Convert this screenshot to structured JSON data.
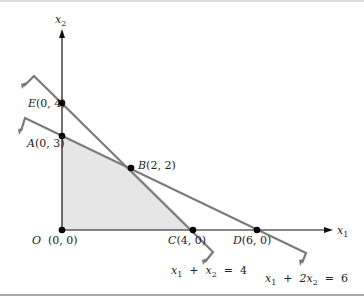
{
  "figure": {
    "axes": {
      "x_label": "x",
      "x_label_sub": "1",
      "y_label": "x",
      "y_label_sub": "2"
    },
    "points": [
      {
        "id": "O",
        "letter": "O",
        "coords": "(0, 0)",
        "x": 0,
        "y": 0
      },
      {
        "id": "A",
        "letter": "A",
        "coords": "(0, 3)",
        "x": 0,
        "y": 3
      },
      {
        "id": "B",
        "letter": "B",
        "coords": "(2, 2)",
        "x": 2,
        "y": 2
      },
      {
        "id": "C",
        "letter": "C",
        "coords": "(4, 0)",
        "x": 4,
        "y": 0
      },
      {
        "id": "D",
        "letter": "D",
        "coords": "(6, 0)",
        "x": 6,
        "y": 0
      },
      {
        "id": "E",
        "letter": "E",
        "coords": "(0, 4)",
        "x": 0,
        "y": 4
      }
    ],
    "constraints": [
      {
        "id": "c1",
        "equation": "x1 + x2 = 4",
        "lhs_a": "x",
        "lhs_a_sub": "1",
        "plus": "+",
        "lhs_b": "x",
        "lhs_b_sub": "2",
        "equals": "=",
        "rhs": "4"
      },
      {
        "id": "c2",
        "equation": "x1 + 2x2 = 6",
        "lhs_a": "x",
        "lhs_a_sub": "1",
        "plus": "+",
        "lhs_b": "2x",
        "lhs_b_sub": "2",
        "equals": "=",
        "rhs": "6"
      }
    ],
    "feasible_region": {
      "vertices": [
        "O",
        "A",
        "B",
        "C"
      ],
      "fill_color": "#e6e6e6"
    },
    "colors": {
      "axis": "#111111",
      "constraint_line": "#7a7a7a",
      "point": "#000000",
      "border": "#8c8c8c"
    }
  }
}
